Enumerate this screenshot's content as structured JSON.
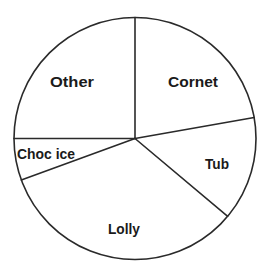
{
  "chart_data": {
    "type": "pie",
    "title": "",
    "categories": [
      "Cornet",
      "Tub",
      "Lolly",
      "Choc ice",
      "Other"
    ],
    "values": [
      80,
      50,
      120,
      20,
      90
    ],
    "units": "degrees",
    "start_angle_deg": 90,
    "direction": "clockwise",
    "legend": "none",
    "labels_inside_slices": true,
    "slice_fill": "#ffffff",
    "stroke_color": "#2a2a2a",
    "label_color": "#1a1a1a"
  },
  "labels": {
    "cornet": "Cornet",
    "tub": "Tub",
    "lolly": "Lolly",
    "choc_ice": "Choc ice",
    "other": "Other"
  }
}
